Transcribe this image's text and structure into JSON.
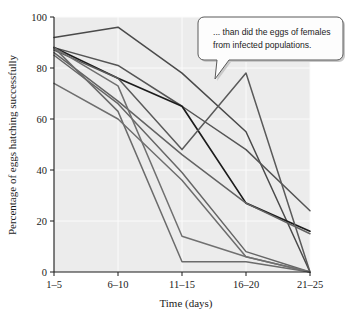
{
  "figure": {
    "background_color": "#ffffff",
    "plot_background_color": "#ececec",
    "gridline_color": "#fbfbfb",
    "axis_color": "#1a1a1a"
  },
  "callout": {
    "name": "annotation-callout",
    "line1": "... than did the eggs of females",
    "line2": "from infected populations.",
    "fill": "#fdfdfd",
    "border": "#5a5a5a"
  },
  "chart_data": {
    "type": "line",
    "title": "",
    "xlabel": "Time (days)",
    "ylabel": "Percentage of eggs hatching successfully",
    "categories": [
      "1–5",
      "6–10",
      "11–15",
      "16–20",
      "21–25"
    ],
    "yticks": [
      0,
      20,
      40,
      60,
      80,
      100
    ],
    "ylim": [
      0,
      100
    ],
    "grid": true,
    "legend": "none",
    "series": [
      {
        "name": "population-1",
        "color": "#4a4a4a",
        "width": 1.5,
        "values": [
          92,
          96,
          78,
          55,
          0
        ]
      },
      {
        "name": "population-2",
        "color": "#555555",
        "width": 1.5,
        "values": [
          88,
          81,
          65,
          48,
          24
        ]
      },
      {
        "name": "population-3",
        "color": "#1c1c1c",
        "width": 1.7,
        "values": [
          88,
          76,
          65,
          27,
          16
        ]
      },
      {
        "name": "population-4",
        "color": "#5a5a5a",
        "width": 1.5,
        "values": [
          87,
          76,
          48,
          78,
          0
        ]
      },
      {
        "name": "population-5",
        "color": "#636363",
        "width": 1.5,
        "values": [
          86,
          67,
          46,
          27,
          15
        ]
      },
      {
        "name": "population-6",
        "color": "#666666",
        "width": 1.5,
        "values": [
          85,
          66,
          39,
          8,
          0
        ]
      },
      {
        "name": "population-7",
        "color": "#6b6b6b",
        "width": 1.5,
        "values": [
          88,
          63,
          4,
          4,
          0
        ]
      },
      {
        "name": "population-8",
        "color": "#6e6e6e",
        "width": 1.5,
        "values": [
          74,
          60,
          36,
          6,
          0
        ]
      },
      {
        "name": "population-9",
        "color": "#707070",
        "width": 1.5,
        "values": [
          88,
          73,
          14,
          6,
          0
        ]
      }
    ]
  }
}
